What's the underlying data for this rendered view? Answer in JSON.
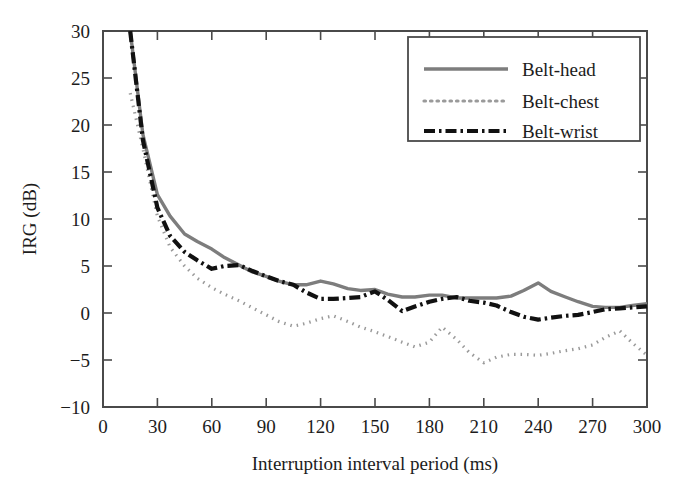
{
  "chart_data": {
    "type": "line",
    "title": "",
    "xlabel": "Interruption interval period (ms)",
    "ylabel": "IRG (dB)",
    "xlim": [
      0,
      300
    ],
    "ylim": [
      -10,
      30
    ],
    "xticks": [
      0,
      30,
      60,
      90,
      120,
      150,
      180,
      210,
      240,
      270,
      300
    ],
    "yticks": [
      -10,
      -5,
      0,
      5,
      10,
      15,
      20,
      25,
      30
    ],
    "xtick_labels": [
      "0",
      "30",
      "60",
      "90",
      "120",
      "150",
      "180",
      "210",
      "240",
      "270",
      "300"
    ],
    "ytick_labels": [
      "-10",
      "-5",
      "0",
      "5",
      "10",
      "15",
      "20",
      "25",
      "30"
    ],
    "grid": false,
    "legend_position": "top-right",
    "series": [
      {
        "name": "Belt-head",
        "color": "#7d7d7d",
        "linestyle": "solid",
        "x": [
          15,
          22,
          30,
          37,
          45,
          52,
          60,
          67,
          75,
          82,
          90,
          97,
          105,
          112,
          120,
          127,
          135,
          142,
          150,
          157,
          165,
          172,
          180,
          187,
          195,
          202,
          210,
          217,
          225,
          232,
          240,
          247,
          255,
          262,
          270,
          277,
          285,
          292,
          300
        ],
        "y": [
          30.0,
          19.0,
          12.6,
          10.3,
          8.4,
          7.6,
          6.8,
          5.9,
          5.1,
          4.4,
          3.9,
          3.4,
          3.0,
          3.0,
          3.4,
          3.1,
          2.6,
          2.4,
          2.5,
          2.0,
          1.7,
          1.7,
          1.9,
          1.9,
          1.6,
          1.6,
          1.6,
          1.6,
          1.8,
          2.4,
          3.2,
          2.3,
          1.7,
          1.2,
          0.7,
          0.6,
          0.6,
          0.8,
          1.0
        ]
      },
      {
        "name": "Belt-chest",
        "color": "#9a9a9a",
        "linestyle": "dotted",
        "x": [
          15,
          22,
          30,
          37,
          45,
          52,
          60,
          67,
          75,
          82,
          90,
          97,
          105,
          112,
          120,
          127,
          135,
          142,
          150,
          157,
          165,
          172,
          180,
          187,
          195,
          202,
          210,
          217,
          225,
          232,
          240,
          247,
          255,
          262,
          270,
          277,
          285,
          292,
          300
        ],
        "y": [
          23.4,
          17.5,
          10.3,
          7.0,
          5.0,
          3.7,
          2.7,
          2.0,
          1.3,
          0.6,
          -0.2,
          -0.9,
          -1.4,
          -1.1,
          -0.6,
          -0.3,
          -0.9,
          -1.5,
          -2.0,
          -2.5,
          -3.1,
          -3.6,
          -3.1,
          -1.5,
          -2.8,
          -4.2,
          -5.3,
          -4.7,
          -4.4,
          -4.4,
          -4.5,
          -4.3,
          -4.0,
          -3.8,
          -3.4,
          -2.6,
          -1.9,
          -3.2,
          -4.5
        ]
      },
      {
        "name": "Belt-wrist",
        "color": "#111111",
        "linestyle": "dashdot",
        "x": [
          15,
          22,
          30,
          37,
          45,
          52,
          60,
          67,
          75,
          82,
          90,
          97,
          105,
          112,
          120,
          127,
          135,
          142,
          150,
          157,
          165,
          172,
          180,
          187,
          195,
          202,
          210,
          217,
          225,
          232,
          240,
          247,
          255,
          262,
          270,
          277,
          285,
          292,
          300
        ],
        "y": [
          30.0,
          18.4,
          11.2,
          8.2,
          6.5,
          5.6,
          4.7,
          5.0,
          5.1,
          4.5,
          3.9,
          3.4,
          3.0,
          2.2,
          1.5,
          1.5,
          1.6,
          1.7,
          2.3,
          1.4,
          0.2,
          0.7,
          1.2,
          1.5,
          1.7,
          1.3,
          1.1,
          0.8,
          0.1,
          -0.4,
          -0.7,
          -0.5,
          -0.3,
          -0.2,
          0.1,
          0.4,
          0.5,
          0.6,
          0.7
        ]
      }
    ]
  },
  "legend": {
    "items": [
      {
        "label": "Belt-head"
      },
      {
        "label": "Belt-chest"
      },
      {
        "label": "Belt-wrist"
      }
    ]
  },
  "axes": {
    "x_title": "Interruption interval period (ms)",
    "y_title": "IRG (dB)"
  }
}
